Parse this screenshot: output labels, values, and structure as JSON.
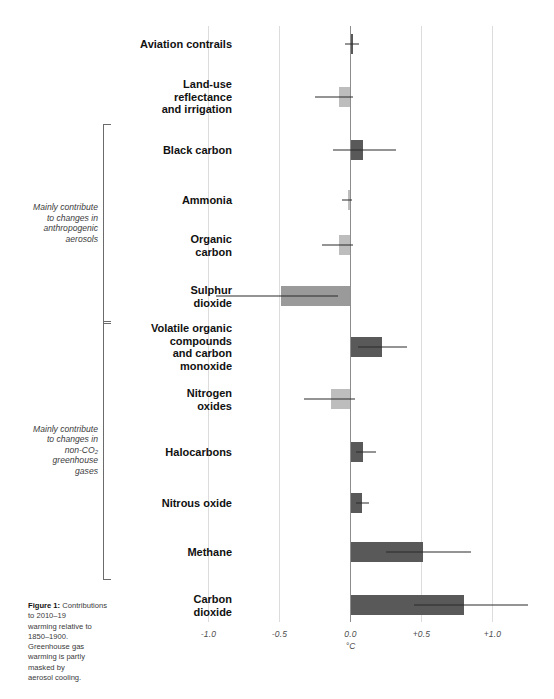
{
  "figure": {
    "caption_title": "Figure 1:",
    "caption_body": "Contributions\nto 2010–19\nwarming relative to\n1850–1900.\nGreenhouse gas\nwarming is partly\nmasked by\naerosol cooling."
  },
  "axis": {
    "unit": "°C",
    "ticks": [
      {
        "label": "-1.0",
        "value": -1.0
      },
      {
        "label": "-0.5",
        "value": -0.5
      },
      {
        "label": "0.0",
        "value": 0.0
      },
      {
        "label": "+0.5",
        "value": 0.5
      },
      {
        "label": "+1.0",
        "value": 1.0
      }
    ]
  },
  "groups": [
    {
      "id": "aerosols",
      "label": "Mainly contribute\nto changes in\nanthropogenic\naerosols",
      "first_row": 2,
      "last_row": 5
    },
    {
      "id": "non-co2-ghg",
      "label": "Mainly contribute\nto changes in\nnon-CO₂\ngreenhouse\ngases",
      "first_row": 6,
      "last_row": 10
    }
  ],
  "chart_data": {
    "type": "bar",
    "orientation": "horizontal",
    "title": "",
    "xlabel": "°C",
    "ylabel": "",
    "xlim": [
      -1.25,
      1.25
    ],
    "grid": true,
    "legend": "none",
    "categories": [
      "Aviation contrails",
      "Land-use reflectance and irrigation",
      "Black carbon",
      "Ammonia",
      "Organic carbon",
      "Sulphur dioxide",
      "Volatile organic compounds and carbon monoxide",
      "Nitrogen oxides",
      "Halocarbons",
      "Nitrous oxide",
      "Methane",
      "Carbon dioxide"
    ],
    "values": [
      0.01,
      -0.08,
      0.09,
      -0.02,
      -0.08,
      -0.49,
      0.22,
      -0.14,
      0.09,
      0.08,
      0.51,
      0.8
    ],
    "error_low": [
      -0.04,
      -0.25,
      -0.12,
      -0.06,
      -0.2,
      -0.95,
      0.05,
      -0.33,
      0.04,
      0.04,
      0.25,
      0.45
    ],
    "error_high": [
      0.06,
      0.02,
      0.32,
      0.01,
      0.02,
      -0.09,
      0.4,
      0.03,
      0.18,
      0.13,
      0.85,
      1.25
    ]
  },
  "rows": [
    {
      "label": "Aviation contrails",
      "value": 0.01,
      "err_low": -0.04,
      "err_high": 0.06,
      "shade": "dark",
      "y": 44
    },
    {
      "label": "Land-use\nreflectance\nand irrigation",
      "value": -0.08,
      "err_low": -0.25,
      "err_high": 0.02,
      "shade": "light",
      "y": 97
    },
    {
      "label": "Black carbon",
      "value": 0.09,
      "err_low": -0.12,
      "err_high": 0.32,
      "shade": "dark",
      "y": 150
    },
    {
      "label": "Ammonia",
      "value": -0.02,
      "err_low": -0.06,
      "err_high": 0.01,
      "shade": "light",
      "y": 200
    },
    {
      "label": "Organic\ncarbon",
      "value": -0.08,
      "err_low": -0.2,
      "err_high": 0.02,
      "shade": "light",
      "y": 245
    },
    {
      "label": "Sulphur\ndioxide",
      "value": -0.49,
      "err_low": -0.95,
      "err_high": -0.09,
      "shade": "mid",
      "y": 296
    },
    {
      "label": "Volatile organic\ncompounds\nand carbon\nmonoxide",
      "value": 0.22,
      "err_low": 0.05,
      "err_high": 0.4,
      "shade": "dark",
      "y": 347
    },
    {
      "label": "Nitrogen\noxides",
      "value": -0.14,
      "err_low": -0.33,
      "err_high": 0.03,
      "shade": "light",
      "y": 399
    },
    {
      "label": "Halocarbons",
      "value": 0.09,
      "err_low": 0.04,
      "err_high": 0.18,
      "shade": "dark",
      "y": 452
    },
    {
      "label": "Nitrous oxide",
      "value": 0.08,
      "err_low": 0.04,
      "err_high": 0.13,
      "shade": "dark",
      "y": 503
    },
    {
      "label": "Methane",
      "value": 0.51,
      "err_low": 0.25,
      "err_high": 0.85,
      "shade": "dark",
      "y": 552
    },
    {
      "label": "Carbon\ndioxide",
      "value": 0.8,
      "err_low": 0.45,
      "err_high": 1.25,
      "shade": "dark",
      "y": 605
    }
  ]
}
